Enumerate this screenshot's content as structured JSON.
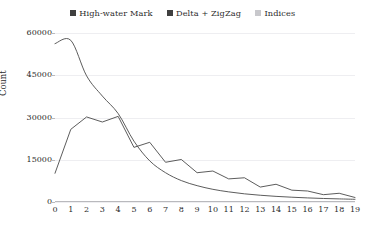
{
  "chart_data": {
    "type": "line",
    "title": "",
    "subtitle": "",
    "xlabel": "",
    "ylabel": "Count",
    "xlim": [
      0,
      19
    ],
    "ylim": [
      0,
      60000
    ],
    "grid": true,
    "legend_position": "top-center",
    "x": [
      0,
      1,
      2,
      3,
      4,
      5,
      6,
      7,
      8,
      9,
      10,
      11,
      12,
      13,
      14,
      15,
      16,
      17,
      18,
      19
    ],
    "xticks": [
      "0",
      "1",
      "2",
      "3",
      "4",
      "5",
      "6",
      "7",
      "8",
      "9",
      "10",
      "11",
      "12",
      "13",
      "14",
      "15",
      "16",
      "17",
      "18",
      "19"
    ],
    "yticks": [
      "0",
      "15000",
      "30000",
      "45000",
      "60000"
    ],
    "ytick_values": [
      0,
      15000,
      30000,
      45000,
      60000
    ],
    "series": [
      {
        "name": "High-water Mark",
        "color": "#4a4a4a",
        "values": [
          56200,
          57400,
          44800,
          37600,
          31400,
          21600,
          14600,
          10400,
          7600,
          5800,
          4500,
          3600,
          2900,
          2400,
          2000,
          1700,
          1450,
          1250,
          1100,
          950
        ]
      },
      {
        "name": "Delta + ZigZag",
        "color": "#4a4a4a",
        "values": [
          10200,
          25800,
          30200,
          28400,
          30400,
          19400,
          21200,
          14100,
          15100,
          10400,
          11000,
          8200,
          8600,
          5300,
          6300,
          4200,
          3900,
          2600,
          3100,
          1600
        ]
      },
      {
        "name": "Indices",
        "color": "#c8c8cc",
        "values": [
          0,
          0,
          0,
          0,
          0,
          0,
          0,
          0,
          0,
          0,
          0,
          0,
          0,
          0,
          0,
          0,
          0,
          0,
          0,
          0
        ]
      }
    ]
  },
  "legend": {
    "entries": [
      {
        "label": "High-water Mark",
        "color": "#3f3f3f"
      },
      {
        "label": "Delta + ZigZag",
        "color": "#3f3f3f"
      },
      {
        "label": "Indices",
        "color": "#c8c8cc"
      }
    ]
  },
  "axes": {
    "ylabel": "Count"
  }
}
